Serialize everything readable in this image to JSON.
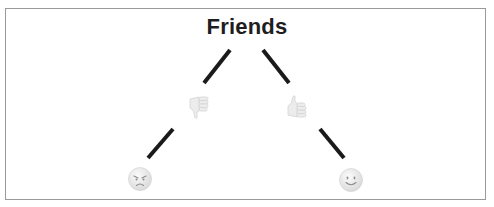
{
  "diagram": {
    "type": "tree",
    "root": {
      "label": "Friends"
    },
    "branches": [
      {
        "name": "dislike",
        "icon": "thumbs-down-icon",
        "leaf_icon": "angry-face-icon"
      },
      {
        "name": "like",
        "icon": "thumbs-up-icon",
        "leaf_icon": "smiling-face-icon"
      }
    ],
    "colors": {
      "edge": "#1a1a1a",
      "border": "#9a9a9a",
      "title": "#1e1e1e",
      "icon": "#e3e3e3"
    }
  }
}
